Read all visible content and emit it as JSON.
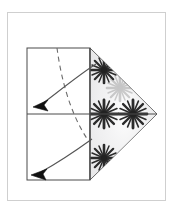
{
  "canvas": {
    "width": 172,
    "height": 220,
    "background": "#ffffff"
  },
  "frame": {
    "name": "figure-border",
    "x": 7,
    "y": 12,
    "width": 159,
    "height": 189,
    "stroke": "#cfcfcf",
    "fill": "#ffffff"
  },
  "diagram": {
    "title": "",
    "caption": "",
    "type": "origami-fold-step",
    "line_color": "#4a4a4a",
    "fold_line_color": "#6b6b6b",
    "arrow_color": "#555555",
    "arrowhead_color": "#111111",
    "pattern_color": "#2b2b2b",
    "flap_fill": "#ececed",
    "square": {
      "name": "paper-square",
      "left": 27,
      "top": 48,
      "right": 90,
      "bottom": 180,
      "midline_y": 114
    },
    "flap_triangle": {
      "name": "folded-flap-triangle",
      "points": "90,48 157,114 90,180",
      "fill": "#ececed",
      "stroke": "#4a4a4a"
    },
    "crease_dashed": {
      "name": "dashed-fold-line",
      "path": "M 57,48 C 61,78 70,115 90,143",
      "dash": "5 4",
      "stroke": "#6b6b6b"
    },
    "motifs": [
      {
        "name": "star-motif-top",
        "cx": 104,
        "cy": 70,
        "r": 13,
        "opacity": 1.0
      },
      {
        "name": "star-motif-mid-left",
        "cx": 104,
        "cy": 114,
        "r": 14,
        "opacity": 1.0
      },
      {
        "name": "star-motif-mid-right",
        "cx": 133,
        "cy": 114,
        "r": 14,
        "opacity": 1.0
      },
      {
        "name": "star-motif-bottom",
        "cx": 104,
        "cy": 158,
        "r": 13,
        "opacity": 1.0
      },
      {
        "name": "star-motif-center-faint",
        "cx": 120,
        "cy": 88,
        "r": 13,
        "opacity": 0.22
      }
    ],
    "arrows": [
      {
        "name": "fold-arrow-upper",
        "path": "M 96,64 C 80,74 58,92 42,104",
        "tip_x": 36,
        "tip_y": 106,
        "tip_angle": 203,
        "stroke": "#555555"
      },
      {
        "name": "fold-arrow-lower",
        "path": "M 92,139 C 74,152 52,166 41,172",
        "tip_x": 34,
        "tip_y": 174,
        "tip_angle": 196,
        "stroke": "#555555"
      }
    ]
  }
}
